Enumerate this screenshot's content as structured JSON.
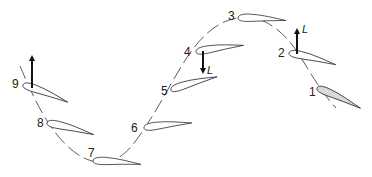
{
  "diagram": {
    "type": "airfoil-flapping-trajectory",
    "path_style": "dashed sinusoidal",
    "colors": {
      "stroke": "#333333",
      "shaded_airfoil": "#d9d9d9",
      "background": "#ffffff"
    },
    "airfoils": [
      {
        "label": "1",
        "shaded": true
      },
      {
        "label": "2",
        "shaded": false
      },
      {
        "label": "3",
        "shaded": false
      },
      {
        "label": "4",
        "shaded": false
      },
      {
        "label": "5",
        "shaded": false
      },
      {
        "label": "6",
        "shaded": false
      },
      {
        "label": "7",
        "shaded": false
      },
      {
        "label": "8",
        "shaded": false
      },
      {
        "label": "9",
        "shaded": false
      }
    ],
    "lift_vectors": [
      {
        "at": "2",
        "direction": "up",
        "label": "L"
      },
      {
        "at": "4",
        "direction": "down",
        "label": "L"
      },
      {
        "at": "9",
        "direction": "up",
        "label": ""
      }
    ]
  }
}
